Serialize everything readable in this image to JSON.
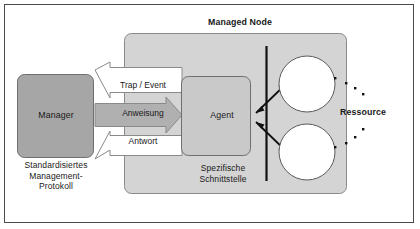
{
  "figure": {
    "title_visible": false,
    "background": "#ffffff",
    "frame_color": "#4a4a4a"
  },
  "colors": {
    "manager_fill": "#a6a6a6",
    "agent_fill": "#c9c9c9",
    "panel_fill": "#d4d4d4",
    "arrow_gray_fill": "#b0b0b0",
    "arrow_white_fill": "#ffffff",
    "stroke": "#4a4a4a",
    "line_black": "#111111",
    "text": "#1a1a1a",
    "circle_fill": "#ffffff"
  },
  "panel": {
    "name": "managed-node",
    "label": "Managed Node"
  },
  "nodes": {
    "manager": {
      "label": "Manager"
    },
    "agent": {
      "label": "Agent"
    }
  },
  "captions": {
    "protocol": "Standardisiertes\nManagement-\nProtokoll",
    "interface": "Spezifische\nSchnittstelle",
    "resource": "Ressource"
  },
  "arrows": [
    {
      "name": "trap-event",
      "label": "Trap / Event",
      "direction": "left",
      "fill": "#ffffff"
    },
    {
      "name": "anweisung",
      "label": "Anweisung",
      "direction": "right",
      "fill": "#b0b0b0"
    },
    {
      "name": "antwort",
      "label": "Antwort",
      "direction": "left",
      "fill": "#ffffff"
    }
  ],
  "resources": {
    "count": 2,
    "shape": "circle",
    "leader_dots": 8
  },
  "interface_bar": {
    "name": "specific-interface-bar",
    "orientation": "vertical"
  }
}
